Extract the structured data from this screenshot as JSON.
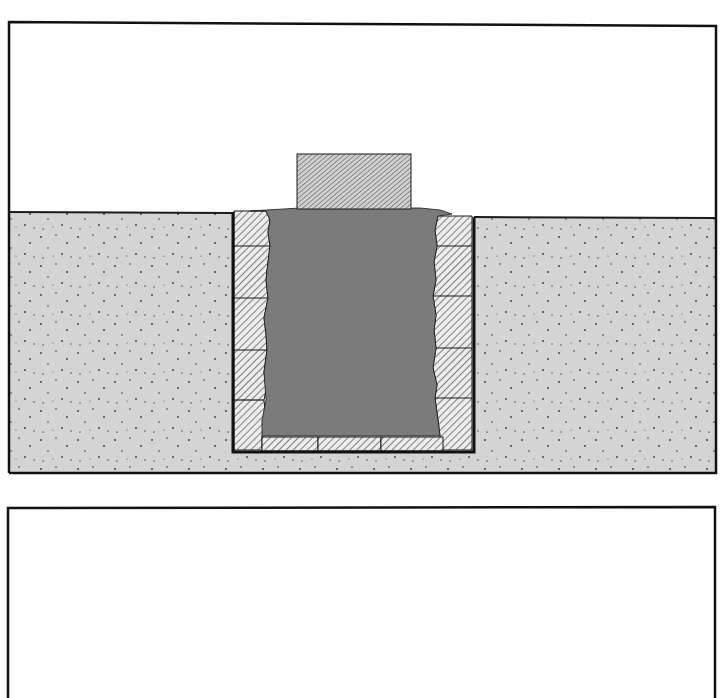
{
  "figure": {
    "type": "cross-section diagram",
    "panels": [
      {
        "id": "top-panel",
        "description": "Cross-section of a stone-lined pit dug into ground, filled with woven/hatched fill, with a cap stone on top",
        "frame": {
          "x1": 9,
          "y1": 22,
          "x2": 716,
          "y2": 473
        },
        "ground_line": {
          "left_y": 212,
          "right_y": 218
        },
        "soil_color": "#d4d4d4",
        "pit": {
          "left": 232,
          "right": 474,
          "bottom": 452
        },
        "left_wall_dividers_y": [
          246,
          298,
          350,
          400
        ],
        "right_wall_dividers_y": [
          246,
          296,
          348,
          398
        ],
        "base_blocks_x": [
          [
            262,
            318
          ],
          [
            318,
            381
          ],
          [
            381,
            443
          ]
        ],
        "cap_stone": {
          "x": 297,
          "y": 154,
          "width": 114,
          "height": 55
        },
        "components": [
          {
            "name": "soil",
            "pattern": "stipple"
          },
          {
            "name": "stone-lining",
            "pattern": "diagonal-hatch"
          },
          {
            "name": "fill",
            "pattern": "basketweave-hatch"
          },
          {
            "name": "cap-stone",
            "pattern": "fine-diagonal-hatch"
          }
        ]
      },
      {
        "id": "bottom-panel",
        "description": "Empty frame (open at bottom edge)",
        "frame": {
          "x1": 8,
          "y1": 508,
          "x2": 715,
          "y2": 698
        }
      }
    ]
  },
  "colors": {
    "line": "#1a1a1a",
    "soil": "#d4d4d4",
    "stone": "#e6e6e6",
    "fill": "#9a9a9a",
    "background": "#ffffff"
  }
}
